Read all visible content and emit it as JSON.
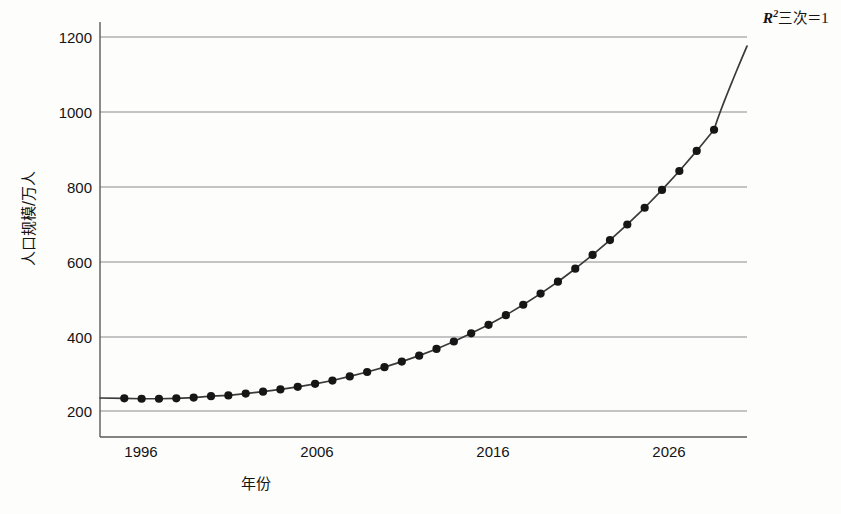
{
  "chart_data": {
    "type": "line",
    "title": "",
    "xlabel": "年份",
    "ylabel": "人口规模/万人",
    "annotation": {
      "r_symbol": "R",
      "superscript": "2",
      "fit_label": "三次",
      "equals": "＝",
      "value": "1",
      "full_text": "R²三次＝1"
    },
    "xlim": [
      1993.6,
      2030.9
    ],
    "ylim": [
      128,
      1245
    ],
    "ytick_labels": [
      "200",
      "400",
      "600",
      "800",
      "1000",
      "1200"
    ],
    "yticks": [
      200,
      400,
      600,
      800,
      1000,
      1200
    ],
    "xtick_labels": [
      "1996",
      "2006",
      "2016",
      "2026"
    ],
    "xticks": [
      1996,
      2006,
      2016,
      2026
    ],
    "grid": "horizontal",
    "legend": "none",
    "line_color": "#3a3a3a",
    "marker_color": "#161616",
    "marker_style": "circle",
    "axis_color": "#5a5a5a",
    "grid_color": "#8c8c8c",
    "background_color": "#fdfdfc",
    "x": [
      1995,
      1996,
      1997,
      1998,
      1999,
      2000,
      2001,
      2002,
      2003,
      2004,
      2005,
      2006,
      2007,
      2008,
      2009,
      2010,
      2011,
      2012,
      2013,
      2014,
      2015,
      2016,
      2017,
      2018,
      2019,
      2020,
      2021,
      2022,
      2023,
      2024,
      2025,
      2026,
      2027,
      2028,
      2029
    ],
    "values": [
      232,
      231,
      231,
      232,
      234,
      238,
      240,
      245,
      250,
      256,
      263,
      271,
      280,
      291,
      303,
      316,
      331,
      347,
      365,
      385,
      407,
      430,
      456,
      484,
      514,
      546,
      581,
      618,
      658,
      700,
      745,
      793,
      844,
      898,
      955
    ],
    "line_extension_note": "fitted cubic curve continues past last marker to plot right edge near 1180",
    "curve_end_value": 1180,
    "series": [
      {
        "name": "人口规模",
        "fit": "cubic",
        "r_squared": 1
      }
    ]
  }
}
